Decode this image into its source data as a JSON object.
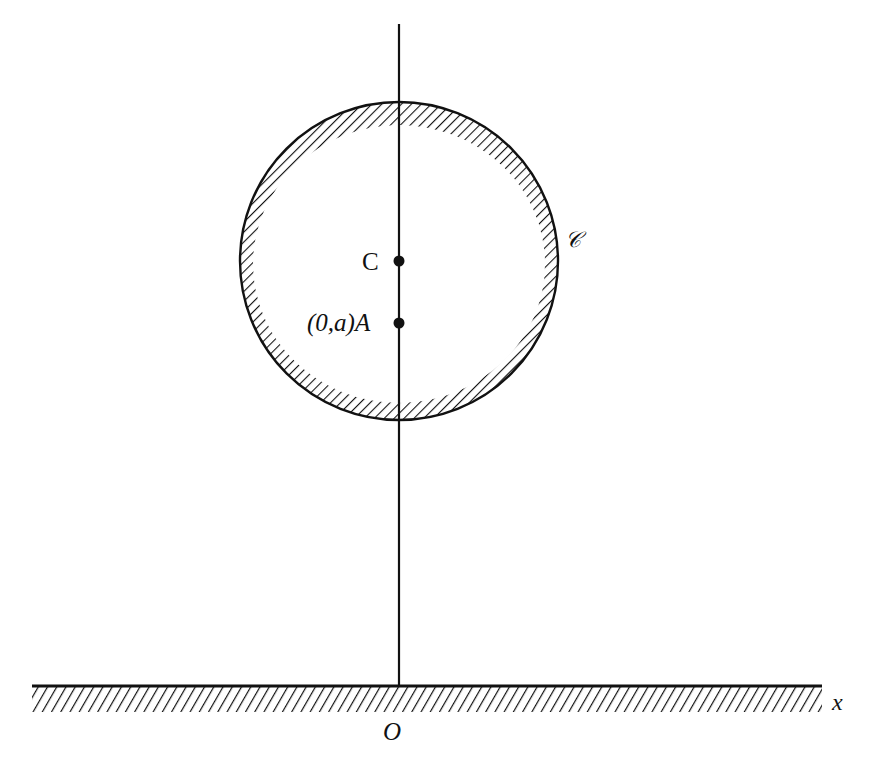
{
  "figure": {
    "labels": {
      "center": "C",
      "point_a": "(0,a)A",
      "point_a_coord": "(0,a)",
      "point_a_name": "A",
      "curve": "𝒞",
      "x_axis": "x",
      "origin": "O"
    },
    "colors": {
      "ink": "#111111",
      "background": "#ffffff"
    },
    "geometry": {
      "circle_center_px": [
        399,
        261
      ],
      "circle_radius_px": 159,
      "ground_y_px": 686,
      "axis_x_px": 399
    }
  }
}
